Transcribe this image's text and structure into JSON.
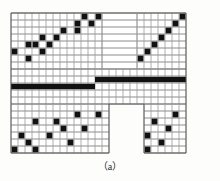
{
  "figure": {
    "label": "（a）",
    "kind": "sparsity-pattern-grid",
    "background_color": "#fdfdfc",
    "grid_line_color": "#6e6e6e",
    "grid_line_color_light": "#9a9a9a",
    "cell_color": "#111111",
    "border_color": "#555555"
  },
  "chart_data": {
    "type": "heatmap",
    "title": "（a）",
    "subtitle": "",
    "xlabel": "",
    "ylabel": "",
    "grid": true,
    "legend_position": "none",
    "cell_size_px": 7,
    "origin_px": {
      "x": 11,
      "y": 13
    },
    "n_cols": 25,
    "n_rows": 20,
    "value_labels": {
      "0": "empty",
      "1": "filled"
    },
    "colors": {
      "0": "#ffffff",
      "1": "#111111"
    },
    "regions": [
      {
        "name": "top-left-block",
        "col_start": 0,
        "col_end": 12,
        "row_start": 0,
        "row_end": 7,
        "ruled": "both"
      },
      {
        "name": "top-notch",
        "col_start": 13,
        "col_end": 17,
        "row_start": 0,
        "row_end": 7,
        "ruled": "horizontal-only"
      },
      {
        "name": "top-right-block",
        "col_start": 18,
        "col_end": 24,
        "row_start": 0,
        "row_end": 7,
        "ruled": "both"
      },
      {
        "name": "middle-full-band",
        "col_start": 0,
        "col_end": 24,
        "row_start": 8,
        "row_end": 12,
        "ruled": "both"
      },
      {
        "name": "bottom-left-block",
        "col_start": 0,
        "col_end": 13,
        "row_start": 13,
        "row_end": 19,
        "ruled": "both"
      },
      {
        "name": "bottom-notch",
        "col_start": 14,
        "col_end": 18,
        "row_start": 13,
        "row_end": 19,
        "ruled": "none"
      },
      {
        "name": "bottom-right-block",
        "col_start": 19,
        "col_end": 24,
        "row_start": 13,
        "row_end": 19,
        "ruled": "both"
      }
    ],
    "filled_cells": [
      [
        10,
        0
      ],
      [
        12,
        0
      ],
      [
        24,
        0
      ],
      [
        9,
        1
      ],
      [
        11,
        1
      ],
      [
        23,
        1
      ],
      [
        7,
        2
      ],
      [
        9,
        2
      ],
      [
        22,
        2
      ],
      [
        4,
        3
      ],
      [
        6,
        3
      ],
      [
        21,
        3
      ],
      [
        2,
        4
      ],
      [
        3,
        4
      ],
      [
        5,
        4
      ],
      [
        20,
        4
      ],
      [
        0,
        5
      ],
      [
        4,
        5
      ],
      [
        19,
        5
      ],
      [
        2,
        6
      ],
      [
        18,
        6
      ]
    ],
    "solid_bars": [
      {
        "name": "upper-bar",
        "col_start": 12,
        "col_end": 24,
        "row": 9,
        "thickness_rows": 1
      },
      {
        "name": "lower-bar",
        "col_start": 0,
        "col_end": 11,
        "row": 10,
        "thickness_rows": 1
      }
    ],
    "bottom_filled_cells": [
      [
        9,
        14
      ],
      [
        12,
        14
      ],
      [
        23,
        14
      ],
      [
        3,
        15
      ],
      [
        6,
        15
      ],
      [
        20,
        15
      ],
      [
        7,
        16
      ],
      [
        10,
        16
      ],
      [
        22,
        16
      ],
      [
        1,
        17
      ],
      [
        5,
        17
      ],
      [
        19,
        17
      ],
      [
        2,
        18
      ],
      [
        8,
        18
      ],
      [
        21,
        18
      ],
      [
        0,
        19
      ],
      [
        3,
        19
      ],
      [
        19,
        19
      ]
    ]
  }
}
